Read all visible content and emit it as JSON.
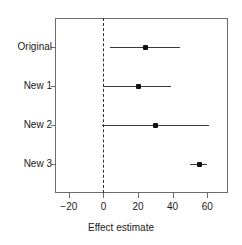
{
  "chart_data": {
    "type": "scatter",
    "subtype": "forest-plot",
    "title": "",
    "xlabel": "Effect estimate",
    "ylabel": "",
    "xlim": [
      -28,
      72
    ],
    "xticks": [
      -20,
      0,
      20,
      40,
      60
    ],
    "xticklabels": [
      "−20",
      "0",
      "20",
      "40",
      "60"
    ],
    "categories": [
      "Original",
      "New 1",
      "New 2",
      "New 3"
    ],
    "grid": false,
    "legend": null,
    "reference_line": {
      "x": 0,
      "style": "dashed",
      "color": "#333333"
    },
    "point_color": "#111111",
    "line_color": "#3a3a3a",
    "frame_color": "#6b6b6b",
    "points": [
      {
        "label": "Original",
        "estimate": 24,
        "ci_low": 4,
        "ci_high": 44
      },
      {
        "label": "New 1",
        "estimate": 20,
        "ci_low": 0,
        "ci_high": 39
      },
      {
        "label": "New 2",
        "estimate": 30,
        "ci_low": -1,
        "ci_high": 61
      },
      {
        "label": "New 3",
        "estimate": 55,
        "ci_low": 50,
        "ci_high": 60
      }
    ]
  },
  "axis": {
    "x_title": "Effect estimate",
    "tick_labels": [
      "−20",
      "0",
      "20",
      "40",
      "60"
    ],
    "category_labels": [
      "Original",
      "New 1",
      "New 2",
      "New 3"
    ]
  }
}
